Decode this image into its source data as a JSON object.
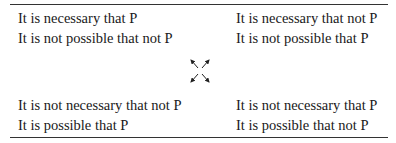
{
  "square_of_opposition": {
    "top_left": {
      "line1": "It is necessary that P",
      "line2": "It is not possible that not P"
    },
    "top_right": {
      "line1": "It is necessary that not P",
      "line2": "It is not possible that P"
    },
    "bottom_left": {
      "line1": "It is not necessary that not P",
      "line2": "It is possible that P"
    },
    "bottom_right": {
      "line1": "It is not necessary that P",
      "line2": "It is possible that not P"
    },
    "center_icon": "four-diagonal-arrows-icon"
  }
}
